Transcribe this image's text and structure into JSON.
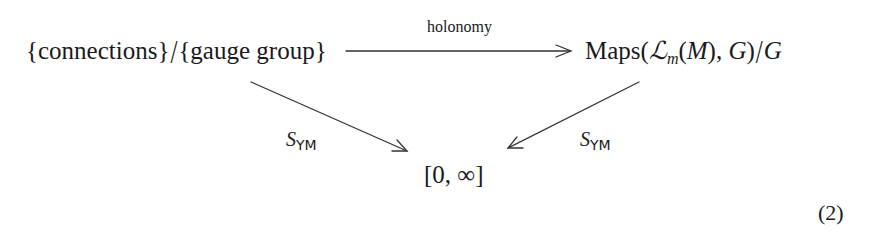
{
  "diagram": {
    "type": "commutative-diagram",
    "nodes": {
      "top_left": {
        "part1": "{connections}",
        "slash": "/",
        "part2": "{gauge group}"
      },
      "top_right": {
        "prefix": "Maps(",
        "script_L": "ℒ",
        "subscript": "m",
        "middle": "(",
        "M": "M",
        "after_M": "), ",
        "G1": "G",
        "close": ")",
        "slash": "/",
        "G2": "G"
      },
      "bottom": {
        "text": "[0, ∞]"
      }
    },
    "edges": [
      {
        "from": "top_left",
        "to": "top_right",
        "label": "holonomy"
      },
      {
        "from": "top_left",
        "to": "bottom",
        "label_main": "S",
        "label_sub": "YM"
      },
      {
        "from": "top_right",
        "to": "bottom",
        "label_main": "S",
        "label_sub": "YM"
      }
    ],
    "equation_number": "(2)"
  }
}
